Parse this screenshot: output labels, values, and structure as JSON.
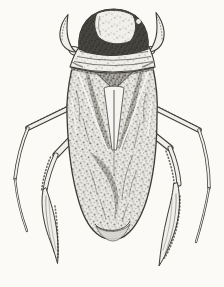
{
  "figure": {
    "subject": "Aquatic bug (saucer bug), dorsal view",
    "style": "black-and-white stipple engraving",
    "alt": "Stipple-engraved scientific drawing of a flattened oval water bug seen from above: rounded head with large dark compound eyes and a pale vertex, short hooked front claws, a striated pronotum, folded wings with a dark central scutellum triangle and pale sutures converging to a point, and two pairs of long slender swimming legs, the hind pair ending in hair-fringed oar-like blades."
  },
  "palette": {
    "paper": "#fbfaf7",
    "ink": "#2e2d29",
    "line": "#3d3b36",
    "body-light": "#eae8e2",
    "body-mid": "#d8d6d0",
    "body-dark": "#b4b2aa",
    "eye-dark": "#26251f",
    "leg": "#f0efe9",
    "highlight": "#f6f5f1"
  }
}
